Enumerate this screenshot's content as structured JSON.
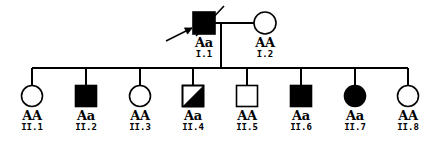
{
  "figure": {
    "type": "pedigree-chart",
    "title": "",
    "line_color": "#000000",
    "fill_affected": "#000000",
    "fill_unaffected": "#ffffff",
    "generations": [
      "I",
      "II"
    ]
  },
  "legend_symbols": {
    "square": "male",
    "circle": "female",
    "filled": "affected",
    "open": "unaffected",
    "half_filled": "partially-affected",
    "slash": "deceased",
    "arrow": "proband"
  },
  "generation_1": {
    "label": "I",
    "members": [
      {
        "id": "I.1",
        "genotype": "Aa",
        "sex": "male",
        "shape": "square",
        "fill": "filled",
        "deceased": true,
        "proband": true,
        "cx": 204,
        "cy": 23,
        "size": 22
      },
      {
        "id": "I.2",
        "genotype": "AA",
        "sex": "female",
        "shape": "circle",
        "fill": "open",
        "deceased": false,
        "proband": false,
        "cx": 265,
        "cy": 23,
        "size": 22
      }
    ],
    "mating_line": {
      "x1": 215,
      "x2": 254,
      "y": 23
    },
    "descent_line": {
      "x": 221,
      "y1": 23,
      "y2": 68
    }
  },
  "generation_2": {
    "label": "II",
    "sibship_line": {
      "x1": 32,
      "x2": 408,
      "y": 68
    },
    "members": [
      {
        "id": "II.1",
        "genotype": "AA",
        "sex": "female",
        "shape": "circle",
        "fill": "open",
        "deceased": false,
        "proband": false,
        "cx": 32,
        "cy": 96,
        "size": 21
      },
      {
        "id": "II.2",
        "genotype": "Aa",
        "sex": "male",
        "shape": "square",
        "fill": "filled",
        "deceased": false,
        "proband": false,
        "cx": 86,
        "cy": 96,
        "size": 21
      },
      {
        "id": "II.3",
        "genotype": "AA",
        "sex": "female",
        "shape": "circle",
        "fill": "open",
        "deceased": false,
        "proband": false,
        "cx": 140,
        "cy": 96,
        "size": 21
      },
      {
        "id": "II.4",
        "genotype": "Aa",
        "sex": "male",
        "shape": "square",
        "fill": "half-filled",
        "deceased": false,
        "proband": false,
        "cx": 193,
        "cy": 96,
        "size": 21
      },
      {
        "id": "II.5",
        "genotype": "AA",
        "sex": "male",
        "shape": "square",
        "fill": "open",
        "deceased": false,
        "proband": false,
        "cx": 247,
        "cy": 96,
        "size": 21
      },
      {
        "id": "II.6",
        "genotype": "Aa",
        "sex": "male",
        "shape": "square",
        "fill": "filled",
        "deceased": false,
        "proband": false,
        "cx": 301,
        "cy": 96,
        "size": 21
      },
      {
        "id": "II.7",
        "genotype": "Aa",
        "sex": "female",
        "shape": "circle",
        "fill": "filled",
        "deceased": false,
        "proband": false,
        "cx": 355,
        "cy": 96,
        "size": 21
      },
      {
        "id": "II.8",
        "genotype": "AA",
        "sex": "female",
        "shape": "circle",
        "fill": "open",
        "deceased": false,
        "proband": false,
        "cx": 408,
        "cy": 96,
        "size": 21
      }
    ]
  },
  "proband_arrow": {
    "tail_x": 166,
    "tail_y": 41,
    "head_x": 192,
    "head_y": 28
  },
  "deceased_slash": {
    "x1": 196,
    "y1": 36,
    "x2": 224,
    "y2": 6
  }
}
